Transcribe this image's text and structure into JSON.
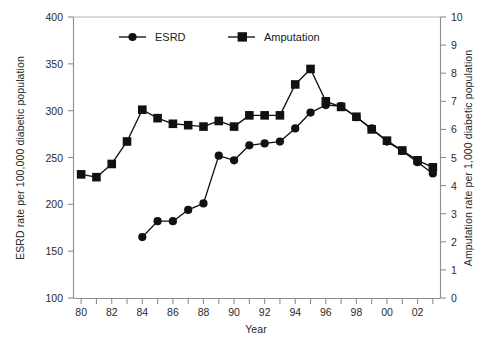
{
  "chart_data": {
    "type": "line",
    "title": "",
    "xlabel": "Year",
    "ylabel": "ESRD rate per 100,000 diabetic population",
    "y2label": "Amputation rate per 1,000 diabetic population",
    "grid": false,
    "legend_position": "top-inside",
    "x": [
      1980,
      1981,
      1982,
      1983,
      1984,
      1985,
      1986,
      1987,
      1988,
      1989,
      1990,
      1991,
      1992,
      1993,
      1994,
      1995,
      1996,
      1997,
      1998,
      1999,
      2000,
      2001,
      2002,
      2003
    ],
    "xtick_labels": [
      "80",
      "",
      "82",
      "",
      "84",
      "",
      "86",
      "",
      "88",
      "",
      "90",
      "",
      "92",
      "",
      "94",
      "",
      "96",
      "",
      "98",
      "",
      "00",
      "",
      "02",
      ""
    ],
    "xtick_labels_shown": [
      "80",
      "82",
      "84",
      "86",
      "88",
      "90",
      "92",
      "94",
      "96",
      "98",
      "00",
      "02"
    ],
    "xlim": [
      1979.5,
      2003.5
    ],
    "ylim": [
      100,
      400
    ],
    "ytick_labels": [
      "100",
      "150",
      "200",
      "250",
      "300",
      "350",
      "400"
    ],
    "ytick_values": [
      100,
      150,
      200,
      250,
      300,
      350,
      400
    ],
    "y2lim": [
      0,
      10
    ],
    "y2tick_labels": [
      "0",
      "1",
      "2",
      "3",
      "4",
      "5",
      "6",
      "7",
      "8",
      "9",
      "10"
    ],
    "y2tick_values": [
      0,
      1,
      2,
      3,
      4,
      5,
      6,
      7,
      8,
      9,
      10
    ],
    "series": [
      {
        "name": "ESRD",
        "axis": "left",
        "marker": "circle",
        "color": "#111111",
        "x": [
          1984,
          1985,
          1986,
          1987,
          1988,
          1989,
          1990,
          1991,
          1992,
          1993,
          1994,
          1995,
          1996,
          1997,
          1998,
          1999,
          2000,
          2001,
          2002,
          2003
        ],
        "values": [
          165,
          182,
          182,
          194,
          201,
          252,
          247,
          263,
          265,
          267,
          281,
          298,
          306,
          305,
          293,
          281,
          267,
          257,
          245,
          233
        ]
      },
      {
        "name": "Amputation",
        "axis": "right",
        "marker": "square",
        "color": "#111111",
        "x": [
          1980,
          1981,
          1982,
          1983,
          1984,
          1985,
          1986,
          1987,
          1988,
          1989,
          1990,
          1991,
          1992,
          1993,
          1994,
          1995,
          1996,
          1997,
          1998,
          1999,
          2000,
          2001,
          2002,
          2003
        ],
        "values": [
          4.4,
          4.3,
          4.77,
          5.57,
          6.7,
          6.4,
          6.2,
          6.15,
          6.1,
          6.3,
          6.1,
          6.5,
          6.5,
          6.5,
          7.6,
          8.15,
          7.0,
          6.8,
          6.45,
          6.0,
          5.6,
          5.25,
          4.9,
          4.65
        ]
      }
    ],
    "legend": [
      {
        "label": "ESRD",
        "marker": "circle"
      },
      {
        "label": "Amputation",
        "marker": "square"
      }
    ]
  }
}
